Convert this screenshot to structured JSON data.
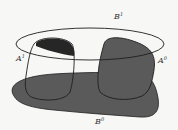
{
  "diagram": {
    "type": "set-diagram",
    "labels": {
      "B1": {
        "base": "B",
        "sup": "1"
      },
      "A1": {
        "base": "A",
        "sup": "1"
      },
      "A0": {
        "base": "A",
        "sup": "0"
      },
      "B0": {
        "base": "B",
        "sup": "0"
      }
    },
    "colors": {
      "background": "#f7f7f5",
      "stroke": "#1e1e1e",
      "gray_fill": "#5a5a5a",
      "dark_fill": "#262626"
    }
  }
}
